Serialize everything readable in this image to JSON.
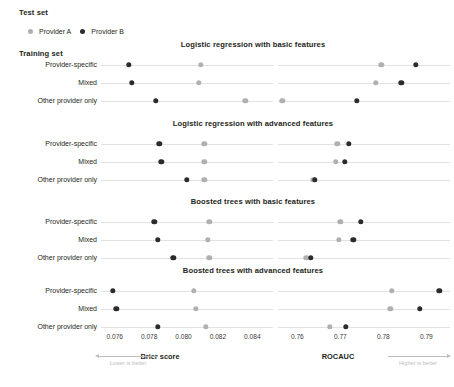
{
  "headers": {
    "test_set": "Test set",
    "training_set": "Training set"
  },
  "legend": {
    "items": [
      {
        "label": "Provider A",
        "color": "#b0b0b0",
        "key": "a"
      },
      {
        "label": "Provider B",
        "color": "#2b2b2b",
        "key": "b"
      }
    ]
  },
  "axes": {
    "brier": {
      "name": "Brier score",
      "ticks": [
        "0.076",
        "0.078",
        "0.080",
        "0.082",
        "0.084"
      ],
      "tick_values": [
        0.076,
        0.078,
        0.08,
        0.082,
        0.084
      ],
      "min": 0.0752,
      "max": 0.0852,
      "direction_note": "Lower is better"
    },
    "rocauc": {
      "name": "ROCAUC",
      "ticks": [
        "0.76",
        "0.77",
        "0.78",
        "0.79"
      ],
      "tick_values": [
        0.76,
        0.77,
        0.78,
        0.79
      ],
      "min": 0.7555,
      "max": 0.7955,
      "direction_note": "Higher is better"
    }
  },
  "rows": [
    "Provider-specific",
    "Mixed",
    "Other provider only"
  ],
  "chart_data": {
    "type": "scatter",
    "xlabel": "Brier score / ROCAUC",
    "ylabel": "Training set",
    "legend_position": "top-left",
    "grid": true,
    "panels": [
      {
        "title": "Logistic regression with basic features",
        "categories": [
          "Provider-specific",
          "Mixed",
          "Other provider only"
        ],
        "metrics": {
          "brier": {
            "series": [
              {
                "name": "Provider A",
                "values": [
                  0.081,
                  0.0809,
                  0.0836
                ]
              },
              {
                "name": "Provider B",
                "values": [
                  0.0768,
                  0.077,
                  0.0784
                ]
              }
            ]
          },
          "rocauc": {
            "series": [
              {
                "name": "Provider A",
                "values": [
                  0.7795,
                  0.7783,
                  0.7565
                ]
              },
              {
                "name": "Provider B",
                "values": [
                  0.7875,
                  0.7842,
                  0.7738
                ]
              }
            ]
          }
        }
      },
      {
        "title": "Logistic regression with advanced features",
        "categories": [
          "Provider-specific",
          "Mixed",
          "Other provider only"
        ],
        "metrics": {
          "brier": {
            "series": [
              {
                "name": "Provider A",
                "values": [
                  0.0812,
                  0.0812,
                  0.0812
                ]
              },
              {
                "name": "Provider B",
                "values": [
                  0.0786,
                  0.0787,
                  0.0802
                ]
              }
            ]
          },
          "rocauc": {
            "series": [
              {
                "name": "Provider A",
                "values": [
                  0.7693,
                  0.769,
                  0.7637
                ]
              },
              {
                "name": "Provider B",
                "values": [
                  0.7719,
                  0.7711,
                  0.764
                ]
              }
            ]
          }
        }
      },
      {
        "title": "Boosted trees with basic features",
        "categories": [
          "Provider-specific",
          "Mixed",
          "Other provider only"
        ],
        "metrics": {
          "brier": {
            "series": [
              {
                "name": "Provider A",
                "values": [
                  0.0815,
                  0.0814,
                  0.0815
                ]
              },
              {
                "name": "Provider B",
                "values": [
                  0.0783,
                  0.0785,
                  0.0794
                ]
              }
            ]
          },
          "rocauc": {
            "series": [
              {
                "name": "Provider A",
                "values": [
                  0.77,
                  0.7696,
                  0.7621
                ]
              },
              {
                "name": "Provider B",
                "values": [
                  0.7748,
                  0.773,
                  0.7631
                ]
              }
            ]
          }
        }
      },
      {
        "title": "Boosted trees with advanced features",
        "categories": [
          "Provider-specific",
          "Mixed",
          "Other provider only"
        ],
        "metrics": {
          "brier": {
            "series": [
              {
                "name": "Provider A",
                "values": [
                  0.0806,
                  0.0807,
                  0.0813
                ]
              },
              {
                "name": "Provider B",
                "values": [
                  0.0759,
                  0.0761,
                  0.0785
                ]
              }
            ]
          },
          "rocauc": {
            "series": [
              {
                "name": "Provider A",
                "values": [
                  0.782,
                  0.7816,
                  0.7675
                ]
              },
              {
                "name": "Provider B",
                "values": [
                  0.793,
                  0.7885,
                  0.7713
                ]
              }
            ]
          }
        }
      }
    ]
  }
}
